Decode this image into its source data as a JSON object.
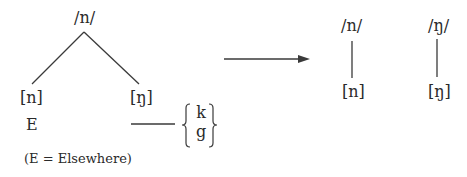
{
  "diagram": {
    "type": "phonological-split",
    "left": {
      "phoneme": "/n/",
      "allophones": [
        {
          "label": "[n]",
          "environment": "E"
        },
        {
          "label": "[ŋ]",
          "environment": "___ {k, g}"
        }
      ],
      "environment_set": [
        "k",
        "g"
      ],
      "elsewhere_marker": "E",
      "footnote": "(E = Elsewhere)"
    },
    "arrow": "right-arrow",
    "right": [
      {
        "phoneme": "/n/",
        "allophone": "[n]"
      },
      {
        "phoneme": "/ŋ/",
        "allophone": "[ŋ]"
      }
    ]
  },
  "colors": {
    "line": "#3a3a3a",
    "text": "#2a2a2a",
    "background": "#ffffff"
  }
}
